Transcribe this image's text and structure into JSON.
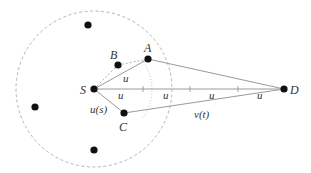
{
  "diagram": {
    "type": "network-routing-geometry",
    "colors": {
      "line": "#9a9a9a",
      "dashed": "#aaaaaa",
      "node": "#111111",
      "text": "#333333"
    },
    "range_circle": {
      "cx": 94,
      "cy": 89,
      "r": 78,
      "style": "dashed"
    },
    "inner_arc": {
      "cx": 94,
      "cy": 89,
      "r": 49,
      "style": "dotted"
    },
    "nodes": [
      {
        "id": "S",
        "label": "S",
        "x": 94,
        "y": 89
      },
      {
        "id": "D",
        "label": "D",
        "x": 284,
        "y": 89
      },
      {
        "id": "A",
        "label": "A",
        "x": 148,
        "y": 59
      },
      {
        "id": "B",
        "label": "B",
        "x": 118,
        "y": 65
      },
      {
        "id": "C",
        "label": "C",
        "x": 124,
        "y": 113
      },
      {
        "id": "n1",
        "label": "",
        "x": 88,
        "y": 25
      },
      {
        "id": "n2",
        "label": "",
        "x": 35,
        "y": 107
      },
      {
        "id": "n3",
        "label": "",
        "x": 94,
        "y": 150
      }
    ],
    "edge_labels": {
      "u_SA": "u",
      "u1": "u",
      "u2": "u",
      "u3": "u",
      "u4": "u",
      "us": "u(s)",
      "vt": "v(t)"
    },
    "ticks_x": [
      143,
      172,
      190,
      238
    ]
  }
}
